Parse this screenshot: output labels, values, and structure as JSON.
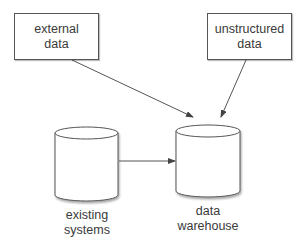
{
  "diagram": {
    "type": "data-flow",
    "nodes": [
      {
        "id": "external",
        "shape": "rectangle",
        "lines": [
          "external",
          "data"
        ]
      },
      {
        "id": "unstructured",
        "shape": "rectangle",
        "lines": [
          "unstructured",
          "data"
        ]
      },
      {
        "id": "existing",
        "shape": "cylinder",
        "lines": [
          "existing",
          "systems"
        ]
      },
      {
        "id": "warehouse",
        "shape": "cylinder",
        "lines": [
          "data",
          "warehouse"
        ]
      }
    ],
    "edges": [
      {
        "from": "external",
        "to": "warehouse"
      },
      {
        "from": "unstructured",
        "to": "warehouse"
      },
      {
        "from": "existing",
        "to": "warehouse"
      }
    ],
    "colors": {
      "stroke": "#555555",
      "text": "#3a3a3a",
      "background": "#ffffff"
    }
  }
}
